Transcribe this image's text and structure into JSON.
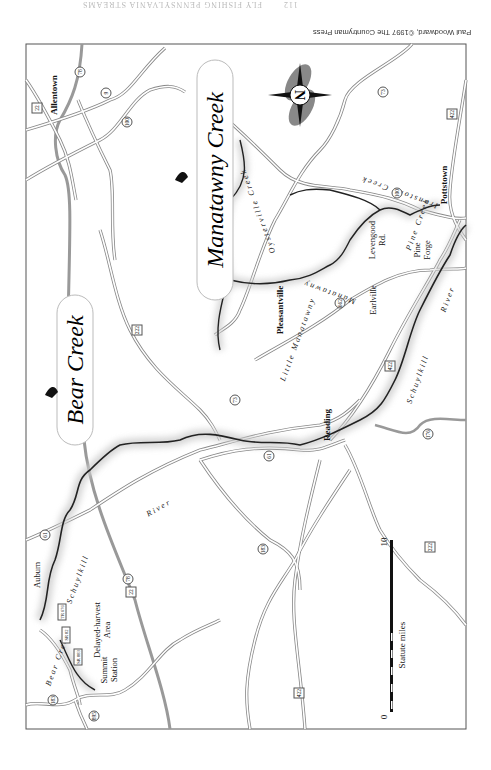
{
  "page": {
    "orientation": "rotated-180",
    "running_head": "FLY FISHING PENNSYLVANIA STREAMS",
    "page_number": "112",
    "credit": "Paul Woodward, ©1997 The Countryman Press"
  },
  "map": {
    "titles": [
      {
        "label": "Bear Creek"
      },
      {
        "label": "Manatawny Creek"
      }
    ],
    "towns": [
      {
        "label": "Allentown"
      },
      {
        "label": "Pottstown"
      },
      {
        "label": "Reading"
      },
      {
        "label": "Pleasantville"
      },
      {
        "label": "Earlville"
      },
      {
        "label": "Pine"
      },
      {
        "label": "Forge"
      },
      {
        "label": "Levengood"
      },
      {
        "label": "Rd."
      },
      {
        "label": "Auburn"
      },
      {
        "label": "Summit"
      },
      {
        "label": "Station"
      },
      {
        "label": "Delayed-harvest"
      },
      {
        "label": "Area"
      }
    ],
    "waterways": [
      {
        "label": "Schuylkill"
      },
      {
        "label": "River"
      },
      {
        "label": "Manatawny"
      },
      {
        "label": "Little Manatawny"
      },
      {
        "label": "Oysterville Creek"
      },
      {
        "label": "Ironstone Creek"
      },
      {
        "label": "Pine Creek"
      },
      {
        "label": "Bear Creek"
      }
    ],
    "route_shields": [
      {
        "label": "78"
      },
      {
        "label": "22"
      },
      {
        "label": "9"
      },
      {
        "label": "100"
      },
      {
        "label": "73"
      },
      {
        "label": "422"
      },
      {
        "label": "222"
      },
      {
        "label": "662"
      },
      {
        "label": "61"
      },
      {
        "label": "176"
      },
      {
        "label": "183"
      },
      {
        "label": "895"
      },
      {
        "label": "TR 676"
      },
      {
        "label": "SR 82"
      },
      {
        "label": "SR 883"
      }
    ],
    "scale": {
      "label": "Statute miles",
      "start": "0",
      "end": "10"
    },
    "compass": {
      "label": "N"
    }
  }
}
